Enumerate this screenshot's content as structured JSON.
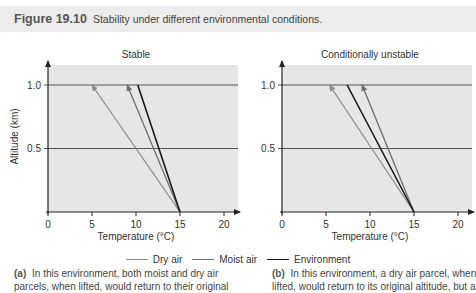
{
  "figure": {
    "number": "Figure 19.10",
    "title": "Stability under different environmental conditions."
  },
  "legend": [
    {
      "label": "Dry air",
      "color": "#8c8c8c"
    },
    {
      "label": "Moist air",
      "color": "#6e6e6e"
    },
    {
      "label": "Environment",
      "color": "#1a1a1a"
    }
  ],
  "captions": {
    "a": {
      "tag": "(a)",
      "line1": "In this environment, both moist and dry air",
      "line2": "parcels, when lifted, would return to their original"
    },
    "b": {
      "tag": "(b)",
      "line1": "In this environment, a dry air parcel, when",
      "line2": "lifted, would return to its original altitude, but a"
    }
  },
  "colors": {
    "plot_bg": "#e6e6e6",
    "axis": "#222222",
    "gridline": "#555555",
    "title_bar_bg": "#ececec"
  },
  "chart_data": [
    {
      "type": "line",
      "title": "Stable",
      "xlabel": "Temperature (°C)",
      "ylabel": "Altitude (km)",
      "xlim": [
        0,
        22
      ],
      "ylim": [
        0,
        1.15
      ],
      "xticks": [
        0,
        5,
        10,
        15,
        20
      ],
      "yticks": [
        0.5,
        1.0
      ],
      "grid": "horizontal lines at 0.5 and 1.0",
      "series": [
        {
          "name": "Dry air",
          "points": [
            [
              15,
              0
            ],
            [
              5,
              1.0
            ]
          ],
          "arrow": true
        },
        {
          "name": "Moist air",
          "points": [
            [
              15,
              0
            ],
            [
              9,
              1.0
            ]
          ],
          "arrow": true
        },
        {
          "name": "Environment",
          "points": [
            [
              15,
              0
            ],
            [
              10.2,
              1.0
            ]
          ],
          "arrow": false
        }
      ]
    },
    {
      "type": "line",
      "title": "Conditionally unstable",
      "xlabel": "Temperature (°C)",
      "ylabel": "",
      "xlim": [
        0,
        22
      ],
      "ylim": [
        0,
        1.15
      ],
      "xticks": [
        0,
        5,
        10,
        15,
        20
      ],
      "yticks": [
        0.5,
        1.0
      ],
      "grid": "horizontal lines at 0.5 and 1.0",
      "series": [
        {
          "name": "Dry air",
          "points": [
            [
              15,
              0
            ],
            [
              5.4,
              1.0
            ]
          ],
          "arrow": true
        },
        {
          "name": "Moist air",
          "points": [
            [
              15,
              0
            ],
            [
              9.1,
              1.0
            ]
          ],
          "arrow": true
        },
        {
          "name": "Environment",
          "points": [
            [
              15,
              0
            ],
            [
              7.4,
              1.0
            ]
          ],
          "arrow": false
        }
      ]
    }
  ]
}
